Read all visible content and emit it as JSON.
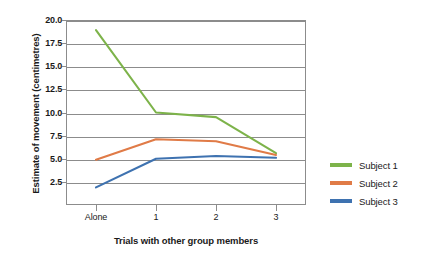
{
  "chart_data": {
    "type": "line",
    "title": "",
    "xlabel": "Trials with other group members",
    "ylabel": "Estimate of movement (centimetres)",
    "categories": [
      "Alone",
      "1",
      "2",
      "3"
    ],
    "x_tick_labels": [
      "Alone",
      "1",
      "2",
      "3"
    ],
    "y_tick_labels": [
      "2.5",
      "5.0",
      "7.5",
      "10.0",
      "12.5",
      "15.0",
      "17.5",
      "20.0"
    ],
    "y_tick_values": [
      2.5,
      5.0,
      7.5,
      10.0,
      12.5,
      15.0,
      17.5,
      20.0
    ],
    "ylim": [
      0,
      20.0
    ],
    "grid": true,
    "legend_position": "right",
    "series": [
      {
        "name": "Subject 1",
        "color": "#7DB34A",
        "values": [
          18.9,
          10.0,
          9.5,
          5.6
        ]
      },
      {
        "name": "Subject 2",
        "color": "#E07B47",
        "values": [
          4.9,
          7.1,
          6.9,
          5.4
        ]
      },
      {
        "name": "Subject 3",
        "color": "#3E72B0",
        "values": [
          1.9,
          5.0,
          5.3,
          5.1
        ]
      }
    ]
  },
  "axes": {
    "y_title": "Estimate of movement (centimetres)",
    "x_title": "Trials with other group members"
  },
  "legend": {
    "items": [
      {
        "label": "Subject 1",
        "color": "#7DB34A"
      },
      {
        "label": "Subject 2",
        "color": "#E07B47"
      },
      {
        "label": "Subject 3",
        "color": "#3E72B0"
      }
    ]
  },
  "colors": {
    "axis": "#8c8c8c",
    "text": "#1a1a1a",
    "background": "#ffffff"
  }
}
